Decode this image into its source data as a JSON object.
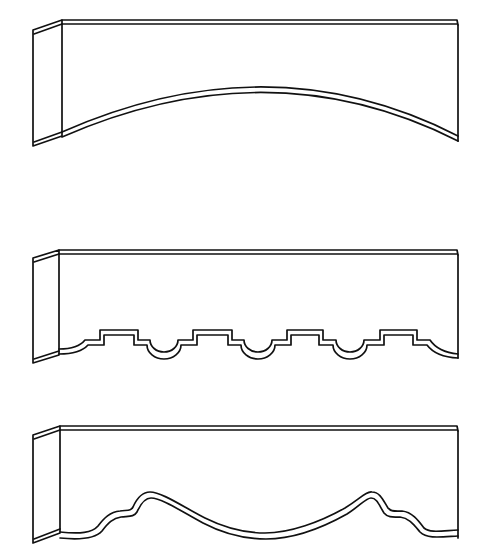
{
  "figure": {
    "stroke_color": "#111111",
    "background_color": "#ffffff",
    "valances": [
      {
        "id": "arched",
        "label": "Arched valance",
        "bottom_style": "single concave arch"
      },
      {
        "id": "scalloped",
        "label": "Stepped scallop valance",
        "bottom_style": "repeating stepped tabs with semicircular dips",
        "tab_count": 4,
        "dip_count": 3
      },
      {
        "id": "wave",
        "label": "Wave valance",
        "bottom_style": "two shouldered peaks with central swag"
      }
    ]
  }
}
